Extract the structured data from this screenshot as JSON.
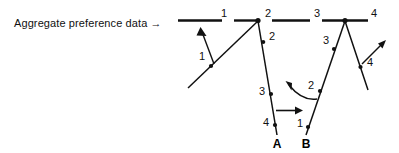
{
  "caption": {
    "label": "Aggregate preference data →"
  },
  "top_bar": {
    "segment_labels": [
      "1",
      "2",
      "3",
      "4"
    ]
  },
  "left_branch": {
    "rising_label": "1",
    "falling_labels": [
      "2",
      "3",
      "4"
    ]
  },
  "right_branch": {
    "rising_labels": [
      "1",
      "2",
      "3"
    ],
    "falling_label": "4"
  },
  "endpoints": {
    "a": "A",
    "b": "B"
  },
  "icons": {
    "up_left_arrow": "up-left-arrow-icon",
    "right_arrow": "right-arrow-icon",
    "curved_left_arrow": "curved-left-arrow-icon",
    "up_right_arrow": "up-right-arrow-icon",
    "caption_arrow": "right-arrow-glyph"
  },
  "colors": {
    "ink": "#111111",
    "background": "#ffffff"
  }
}
